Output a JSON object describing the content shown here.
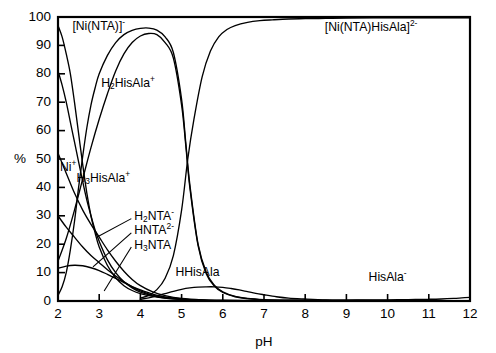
{
  "chart_data": {
    "type": "line",
    "title": "",
    "subtitle": "",
    "xlabel": "pH",
    "ylabel": "%",
    "xlim": [
      2,
      12
    ],
    "ylim": [
      0,
      100
    ],
    "xticks": [
      2,
      3,
      4,
      5,
      6,
      7,
      8,
      9,
      10,
      11,
      12
    ],
    "yticks": [
      0,
      10,
      20,
      30,
      40,
      50,
      60,
      70,
      80,
      90,
      100
    ],
    "grid": false,
    "legend_position": "inline-annotations",
    "line_color": "#000000",
    "background": "#ffffff",
    "series": [
      {
        "name": "[Ni(NTA)]-",
        "label": "[Ni(NTA)]",
        "charge": "-",
        "x": [
          2.0,
          2.1,
          2.2,
          2.3,
          2.4,
          2.5,
          2.6,
          2.7,
          2.8,
          2.9,
          3.0,
          3.2,
          3.4,
          3.6,
          3.8,
          4.0,
          4.2,
          4.4,
          4.6,
          4.8,
          5.0,
          5.1,
          5.2,
          5.4,
          5.6,
          5.8,
          6.0,
          6.3,
          6.6,
          7.0,
          7.5,
          8.0,
          9.0,
          10.0,
          11.0,
          12.0
        ],
        "y": [
          2.0,
          5.0,
          10.0,
          18.0,
          28.0,
          40.0,
          51.0,
          61.0,
          69.0,
          75.0,
          80.0,
          86.5,
          91.0,
          93.8,
          95.3,
          96.0,
          96.1,
          95.4,
          93.0,
          87.5,
          71.0,
          56.0,
          41.0,
          20.0,
          10.0,
          5.5,
          3.2,
          1.6,
          0.9,
          0.5,
          0.3,
          0.2,
          0.1,
          0.1,
          0.1,
          0.1
        ]
      },
      {
        "name": "H2HisAla+",
        "label": "H2HisAla",
        "charge": "+",
        "x": [
          2.0,
          2.2,
          2.4,
          2.6,
          2.8,
          3.0,
          3.2,
          3.4,
          3.6,
          3.8,
          4.0,
          4.2,
          4.4,
          4.6,
          4.8,
          5.0,
          5.1,
          5.2,
          5.4,
          5.6,
          5.8,
          6.0,
          6.3,
          6.6,
          7.0,
          7.5,
          8.0,
          9.0,
          10.0,
          11.0,
          12.0
        ],
        "y": [
          14.0,
          22.0,
          32.0,
          43.0,
          54.0,
          64.0,
          73.0,
          81.0,
          87.0,
          91.0,
          93.3,
          94.2,
          93.8,
          91.0,
          85.5,
          69.0,
          55.0,
          40.0,
          19.5,
          9.5,
          5.2,
          3.0,
          1.5,
          0.8,
          0.4,
          0.2,
          0.2,
          0.1,
          0.1,
          0.1,
          0.1
        ]
      },
      {
        "name": "[Ni(NTA)HisAla]2-",
        "label": "[Ni(NTA)HisAla]",
        "charge": "2-",
        "x": [
          4.0,
          4.2,
          4.4,
          4.6,
          4.8,
          5.0,
          5.15,
          5.3,
          5.5,
          5.7,
          5.9,
          6.1,
          6.3,
          6.6,
          6.9,
          7.2,
          7.6,
          8.0,
          8.5,
          9.0,
          10.0,
          11.0,
          12.0
        ],
        "y": [
          1.0,
          2.0,
          4.0,
          8.0,
          16.0,
          32.0,
          50.0,
          64.0,
          79.0,
          88.0,
          93.0,
          95.6,
          97.0,
          98.1,
          98.7,
          99.0,
          99.3,
          99.4,
          99.5,
          99.6,
          99.7,
          99.7,
          99.7
        ]
      },
      {
        "name": "Ni2+",
        "label": "Ni",
        "charge": "+",
        "x": [
          2.0,
          2.1,
          2.2,
          2.3,
          2.4,
          2.5,
          2.6,
          2.7,
          2.8,
          2.9,
          3.0,
          3.2,
          3.4,
          3.6,
          3.8,
          4.0,
          4.3,
          4.6,
          5.0,
          5.5,
          6.0,
          7.0,
          8.0,
          10.0,
          12.0
        ],
        "y": [
          97.0,
          93.0,
          87.0,
          80.0,
          70.0,
          59.0,
          48.0,
          38.0,
          30.0,
          24.0,
          19.0,
          12.5,
          8.2,
          5.4,
          3.7,
          2.6,
          1.6,
          1.0,
          0.6,
          0.3,
          0.2,
          0.1,
          0.1,
          0.1,
          0.1
        ]
      },
      {
        "name": "H3HisAla+",
        "label": "H3HisAla",
        "charge": "+",
        "x": [
          2.0,
          2.1,
          2.2,
          2.3,
          2.4,
          2.5,
          2.6,
          2.7,
          2.8,
          2.9,
          3.0,
          3.2,
          3.4,
          3.6,
          3.8,
          4.0,
          4.3,
          4.6,
          5.0,
          5.5,
          6.0,
          7.0,
          8.0,
          10.0,
          12.0
        ],
        "y": [
          81.0,
          76.0,
          70.0,
          63.0,
          56.0,
          49.0,
          42.0,
          35.5,
          30.0,
          25.0,
          21.0,
          14.5,
          10.0,
          6.8,
          4.6,
          3.1,
          1.8,
          1.0,
          0.5,
          0.2,
          0.1,
          0.1,
          0.1,
          0.1,
          0.1
        ]
      },
      {
        "name": "H2NTA-",
        "label": "H2NTA",
        "charge": "-",
        "x": [
          2.0,
          2.2,
          2.4,
          2.6,
          2.8,
          3.0,
          3.2,
          3.4,
          3.6,
          3.8,
          4.0,
          4.3,
          4.6,
          5.0,
          5.5,
          6.0,
          7.0,
          8.0,
          10.0,
          12.0
        ],
        "y": [
          52.0,
          45.0,
          38.0,
          32.0,
          27.0,
          22.5,
          18.0,
          14.0,
          10.5,
          7.6,
          5.4,
          3.2,
          1.9,
          0.9,
          0.4,
          0.2,
          0.1,
          0.1,
          0.1,
          0.1
        ]
      },
      {
        "name": "HNTA2-",
        "label": "HNTA",
        "charge": "2-",
        "x": [
          2.0,
          2.2,
          2.4,
          2.6,
          2.8,
          3.0,
          3.2,
          3.4,
          3.6,
          3.8,
          4.0,
          4.3,
          4.6,
          5.0,
          5.5,
          6.0,
          7.0,
          8.0,
          10.0,
          12.0
        ],
        "y": [
          30.0,
          26.0,
          22.5,
          19.0,
          16.0,
          13.5,
          11.0,
          8.8,
          6.8,
          5.0,
          3.6,
          2.1,
          1.2,
          0.6,
          0.3,
          0.1,
          0.1,
          0.1,
          0.1,
          0.1
        ]
      },
      {
        "name": "H3NTA",
        "label": "H3NTA",
        "charge": "",
        "x": [
          2.0,
          2.2,
          2.4,
          2.6,
          2.8,
          3.0,
          3.2,
          3.4,
          3.6,
          3.8,
          4.0,
          4.3,
          4.6,
          5.0,
          5.5,
          6.0,
          7.0,
          8.0,
          10.0,
          12.0
        ],
        "y": [
          11.5,
          12.3,
          12.6,
          12.4,
          11.7,
          10.7,
          9.4,
          8.0,
          6.5,
          5.1,
          3.9,
          2.4,
          1.4,
          0.7,
          0.3,
          0.2,
          0.1,
          0.1,
          0.1,
          0.1
        ]
      },
      {
        "name": "HHisAla",
        "label": "HHisAla",
        "charge": "",
        "x": [
          4.0,
          4.2,
          4.4,
          4.6,
          4.8,
          5.0,
          5.2,
          5.4,
          5.6,
          5.8,
          6.0,
          6.2,
          6.4,
          6.6,
          6.8,
          7.0,
          7.3,
          7.6,
          8.0,
          8.5,
          9.0,
          10.0,
          11.0,
          12.0
        ],
        "y": [
          0.6,
          1.1,
          1.8,
          2.6,
          3.4,
          4.1,
          4.6,
          4.9,
          5.0,
          5.0,
          4.8,
          4.4,
          3.9,
          3.3,
          2.7,
          2.2,
          1.5,
          1.0,
          0.7,
          0.4,
          0.3,
          0.2,
          0.1,
          0.1
        ]
      },
      {
        "name": "HisAla-",
        "label": "HisAla",
        "charge": "-",
        "x": [
          6.0,
          6.5,
          7.0,
          7.5,
          8.0,
          8.5,
          9.0,
          9.5,
          10.0,
          10.5,
          11.0,
          11.3,
          11.6,
          11.8,
          12.0
        ],
        "y": [
          0.1,
          0.1,
          0.2,
          0.2,
          0.3,
          0.3,
          0.3,
          0.4,
          0.4,
          0.5,
          0.6,
          0.7,
          0.9,
          1.1,
          1.3
        ]
      }
    ],
    "annotations": [
      {
        "id": "ann-ni-nta",
        "text_base": "[Ni(NTA)]",
        "text_sup": "-",
        "x": 2.35,
        "y": 96.5,
        "anchor": "start"
      },
      {
        "id": "ann-h2hisala",
        "text_base": "H",
        "sub": "2",
        "text_mid": "HisAla",
        "text_sup": "+",
        "x": 3.05,
        "y": 76.5,
        "anchor": "start"
      },
      {
        "id": "ann-ni",
        "text_base": "Ni",
        "text_sup": "+",
        "x": 2.05,
        "y": 47.0,
        "anchor": "start"
      },
      {
        "id": "ann-h3hisala",
        "text_base": "H",
        "sub": "3",
        "text_mid": "HisAla",
        "text_sup": "+",
        "x": 2.45,
        "y": 43.0,
        "anchor": "start"
      },
      {
        "id": "ann-h2nta",
        "text_base": "H",
        "sub": "2",
        "text_mid": "NTA",
        "text_sup": "-",
        "x": 3.85,
        "y": 29.5,
        "anchor": "start"
      },
      {
        "id": "ann-hnta",
        "text_base": "HNTA",
        "text_sup": "2-",
        "x": 3.85,
        "y": 24.5,
        "anchor": "start"
      },
      {
        "id": "ann-h3nta",
        "text_base": "H",
        "sub": "3",
        "text_mid": "NTA",
        "text_sup": "",
        "x": 3.85,
        "y": 19.5,
        "anchor": "start"
      },
      {
        "id": "ann-hhisala",
        "text_base": "HHisAla",
        "text_sup": "",
        "x": 4.85,
        "y": 10.0,
        "anchor": "start"
      },
      {
        "id": "ann-nintahisala",
        "text_base": "[Ni(NTA)HisAla]",
        "text_sup": "2-",
        "x": 9.6,
        "y": 96.0,
        "anchor": "middle"
      },
      {
        "id": "ann-hisala",
        "text_base": "HisAla",
        "text_sup": "-",
        "x": 10.0,
        "y": 8.0,
        "anchor": "middle"
      }
    ],
    "leader_lines": [
      {
        "id": "leader-h2nta",
        "x1": 3.78,
        "y1": 29.0,
        "x2": 2.95,
        "y2": 22.5
      },
      {
        "id": "leader-hnta",
        "x1": 3.78,
        "y1": 24.0,
        "x2": 2.85,
        "y2": 12.0
      },
      {
        "id": "leader-h3nta",
        "x1": 3.78,
        "y1": 19.0,
        "x2": 3.12,
        "y2": 3.5
      }
    ]
  },
  "axes": {
    "y_label": "%",
    "x_label": "pH",
    "y_tick_labels": [
      "0",
      "10",
      "20",
      "30",
      "40",
      "50",
      "60",
      "70",
      "80",
      "90",
      "100"
    ],
    "x_tick_labels": [
      "2",
      "3",
      "4",
      "5",
      "6",
      "7",
      "8",
      "9",
      "10",
      "11",
      "12"
    ]
  }
}
